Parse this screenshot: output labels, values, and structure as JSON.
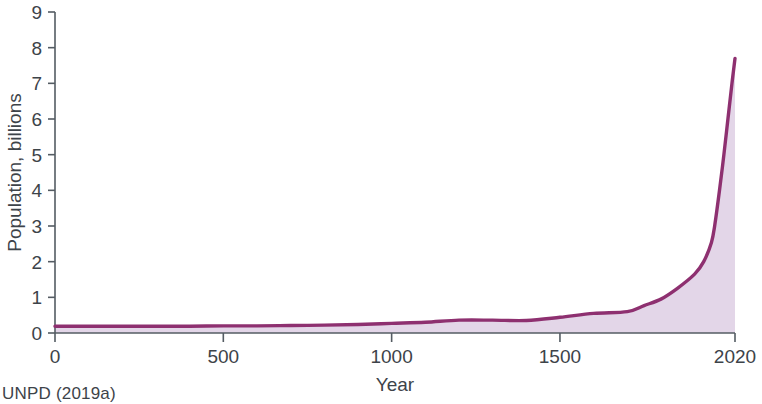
{
  "chart_data": {
    "type": "area",
    "title": "",
    "subtitle": "",
    "xlabel": "Year",
    "ylabel": "Population, billions",
    "xlim": [
      0,
      2020
    ],
    "ylim": [
      0,
      9
    ],
    "grid": false,
    "legend": null,
    "x_ticks": [
      0,
      500,
      1000,
      1500,
      2020
    ],
    "x_tick_labels": [
      "0",
      "500",
      "1000",
      "1500",
      "2020"
    ],
    "y_ticks": [
      0,
      1,
      2,
      3,
      4,
      5,
      6,
      7,
      8,
      9
    ],
    "y_tick_labels": [
      "0",
      "1",
      "2",
      "3",
      "4",
      "5",
      "6",
      "7",
      "8",
      "9"
    ],
    "series": [
      {
        "name": "World population",
        "line_color": "#8e3070",
        "fill_color": "#e3d6e8",
        "x": [
          0,
          100,
          200,
          300,
          400,
          500,
          600,
          700,
          800,
          900,
          1000,
          1100,
          1200,
          1300,
          1400,
          1500,
          1600,
          1700,
          1750,
          1800,
          1850,
          1900,
          1927,
          1950,
          1960,
          1974,
          1987,
          1999,
          2011,
          2020
        ],
        "values": [
          0.19,
          0.19,
          0.19,
          0.19,
          0.19,
          0.2,
          0.2,
          0.21,
          0.22,
          0.24,
          0.27,
          0.3,
          0.36,
          0.36,
          0.35,
          0.44,
          0.55,
          0.6,
          0.77,
          0.95,
          1.26,
          1.65,
          2.0,
          2.54,
          3.03,
          4.0,
          5.0,
          6.0,
          7.0,
          7.7
        ]
      }
    ],
    "annotations": []
  },
  "axes": {
    "x_axis_label": "Year",
    "y_axis_label": "Population, billions"
  },
  "source": {
    "note": "UNPD (2019a)"
  },
  "colors": {
    "line": "#8e3070",
    "fill": "#e3d6e8",
    "axis": "#545c63",
    "text": "#3d4349",
    "background": "#ffffff"
  }
}
